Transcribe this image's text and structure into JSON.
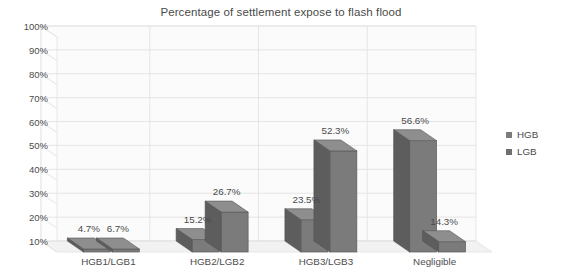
{
  "chart_data": {
    "type": "bar",
    "title": "Percentage of settlement expose to flash flood",
    "xlabel": "",
    "ylabel": "",
    "ylim": [
      10,
      100
    ],
    "ytick_step": 10,
    "grid": true,
    "three_d": true,
    "legend_position": "right",
    "categories": [
      "HGB1/LGB1",
      "HGB2/LGB2",
      "HGB3/LGB3",
      "Negligible"
    ],
    "series": [
      {
        "name": "HGB",
        "values": [
          4.7,
          15.2,
          23.5,
          56.6
        ],
        "color": "#7b7b7b"
      },
      {
        "name": "LGB",
        "values": [
          6.7,
          26.7,
          52.3,
          14.3
        ],
        "color": "#6f6f6f"
      }
    ],
    "value_labels": [
      [
        "4.7%",
        "6.7%"
      ],
      [
        "15.2%",
        "26.7%"
      ],
      [
        "23.5%",
        "52.3%"
      ],
      [
        "56.6%",
        "14.3%"
      ]
    ],
    "ytick_labels": [
      "100%",
      "90%",
      "80%",
      "70%",
      "60%",
      "50%",
      "40%",
      "30%",
      "20%",
      "10%"
    ]
  },
  "legend": {
    "items": [
      {
        "label": "HGB",
        "color": "#7b7b7b"
      },
      {
        "label": "LGB",
        "color": "#6f6f6f"
      }
    ]
  },
  "colors": {
    "background": "#ffffff",
    "gridline": "#e2e2e2",
    "wall": "#fbfbfb",
    "floor": "#f2f2f2",
    "bar_front": "#7b7b7b",
    "bar_side": "#5d5d5d",
    "bar_top": "#8e8e8e",
    "text": "#4a4a4a"
  }
}
